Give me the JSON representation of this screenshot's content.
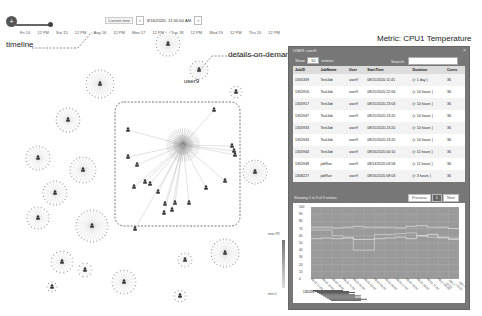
{
  "timeline": {
    "toggle_icon": "plus-icon",
    "ticks": [
      "Fri 14",
      "12 PM",
      "Sat 15",
      "12 PM",
      "Aug 16",
      "12 PM",
      "Mon 17",
      "12 PM",
      "Tue 18",
      "12 PM",
      "Wed 19",
      "12 PM",
      "Thu 20",
      "12 PM"
    ],
    "current_time_label": "Current time",
    "current_time_value": "8/16/2020, 11:50:00 AM",
    "prev_label": "<",
    "next_label": ">"
  },
  "annotations": {
    "timeline": "timeline",
    "details_on_demand": "details-on-demand",
    "metric": "Metric: CPU1 Temperature"
  },
  "graph": {
    "highlight_user_label": "user9",
    "legend_top": "max 99",
    "legend_bottom": "min 0"
  },
  "panel": {
    "title": "USER: user9",
    "close_icon": "close-icon",
    "show_label": "Show",
    "show_value": "10",
    "entries_label": "entries",
    "search_label": "Search:",
    "search_value": "",
    "columns": [
      "JobID",
      "JobName",
      "User",
      "StartTime",
      "Duration",
      "Cores"
    ],
    "rows": [
      [
        "1305339",
        "TestJob",
        "user9",
        "08/15/2020 11:41",
        "(> 1 day )",
        "36"
      ],
      [
        "1305916",
        "TestJob",
        "user9",
        "08/15/2020 22:06",
        "(> 10 hours )",
        "36"
      ],
      [
        "1305917",
        "TestJob",
        "user9",
        "08/15/2020 23:03",
        "(> 10 hours )",
        "36"
      ],
      [
        "1305947",
        "TestJob",
        "user9",
        "08/15/2020 23:20",
        "(> 10 hours )",
        "36"
      ],
      [
        "1305933",
        "TestJob",
        "user9",
        "08/15/2020 23:20",
        "(> 10 hours )",
        "36"
      ],
      [
        "1305943",
        "TestJob",
        "user9",
        "08/15/2020 23:20",
        "(> 10 hours )",
        "36"
      ],
      [
        "1305944",
        "TestJob",
        "user9",
        "08/16/2020 00:10",
        "(> 11 hours )",
        "36"
      ],
      [
        "1305948",
        "jobRun",
        "user9",
        "08/14/2020 03:58",
        "(> 11 hours )",
        "36"
      ],
      [
        "1308227",
        "jobRun",
        "user9",
        "08/16/2020 08:03",
        "(> 3 hours )",
        "36"
      ]
    ],
    "showing_text": "Showing 1 to 9 of 9 entries",
    "pager": {
      "previous": "Previous",
      "current": "1",
      "next": "Next"
    }
  },
  "chart_data": {
    "type": "line",
    "title": "CPU1 Temperature",
    "ylabel": "",
    "xlabel": "",
    "ylim": [
      0,
      100
    ],
    "yticks": [
      0,
      10,
      20,
      30,
      40,
      50,
      60,
      70,
      80,
      90,
      100
    ],
    "grid": true,
    "series": [
      {
        "name": "node-a",
        "values": [
          72,
          72,
          71,
          72,
          73,
          72,
          72,
          72,
          71,
          73,
          74,
          72,
          72,
          70,
          71
        ]
      },
      {
        "name": "node-b",
        "values": [
          68,
          68,
          60,
          58,
          40,
          40,
          62,
          62,
          63,
          64,
          60,
          58,
          57,
          57,
          58
        ]
      },
      {
        "name": "node-c",
        "values": [
          56,
          57,
          56,
          57,
          55,
          55,
          56,
          57,
          58,
          56,
          60,
          62,
          58,
          55,
          55
        ]
      }
    ],
    "x": [
      "08/15 12:00",
      "08/15 15:00",
      "08/15 18:00",
      "08/15 21:00",
      "08/16 00:00",
      "08/16 03:00",
      "08/16 06:00",
      "08/16 09:00",
      "08/16 12:00",
      "08/16 15:00",
      "08/16 18:00",
      "08/16 21:00",
      "08/17 00:00",
      "08/17 03:00",
      "08/17 06:00"
    ],
    "timebar_label": "1305339"
  }
}
